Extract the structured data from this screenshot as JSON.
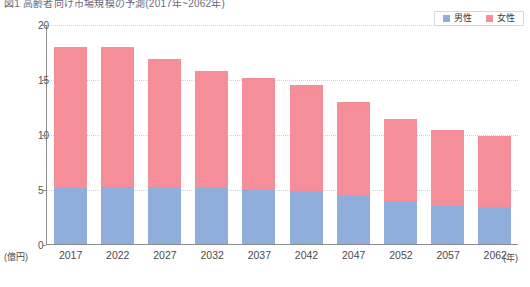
{
  "caption": {
    "text": "図1  高齢者向け市場規模の予測(2017年~2062年)"
  },
  "legend": {
    "position": "top-right",
    "items": [
      {
        "label": "男性",
        "color": "#8FAEDC",
        "key": "male"
      },
      {
        "label": "女性",
        "color": "#F58E98",
        "key": "female"
      }
    ]
  },
  "axes": {
    "y_unit": "(億円)",
    "x_unit": "(年)",
    "y_ticks": [
      "20",
      "15",
      "10",
      "5",
      "0"
    ],
    "y_min": 0,
    "y_max": 20
  },
  "chart_data": {
    "type": "bar",
    "stacked": true,
    "title": "図1  高齢者向け市場規模の予測(2017年~2062年)",
    "xlabel": "(年)",
    "ylabel": "(億円)",
    "ylim": [
      0,
      20
    ],
    "yticks": [
      0,
      5,
      10,
      15,
      20
    ],
    "grid": true,
    "legend_position": "top-right",
    "categories": [
      "2017",
      "2022",
      "2027",
      "2032",
      "2037",
      "2042",
      "2047",
      "2052",
      "2057",
      "2062"
    ],
    "series": [
      {
        "name": "男性",
        "color": "#8FAEDC",
        "values": [
          5.1,
          5.2,
          5.2,
          5.1,
          5.0,
          4.8,
          4.4,
          3.9,
          3.5,
          3.4
        ]
      },
      {
        "name": "女性",
        "color": "#F58E98",
        "values": [
          12.8,
          12.7,
          11.6,
          10.6,
          10.1,
          9.7,
          8.5,
          7.5,
          6.9,
          6.45
        ]
      }
    ],
    "totals": [
      17.9,
      17.9,
      16.8,
      15.7,
      15.1,
      14.5,
      12.9,
      11.4,
      10.4,
      9.85
    ]
  }
}
